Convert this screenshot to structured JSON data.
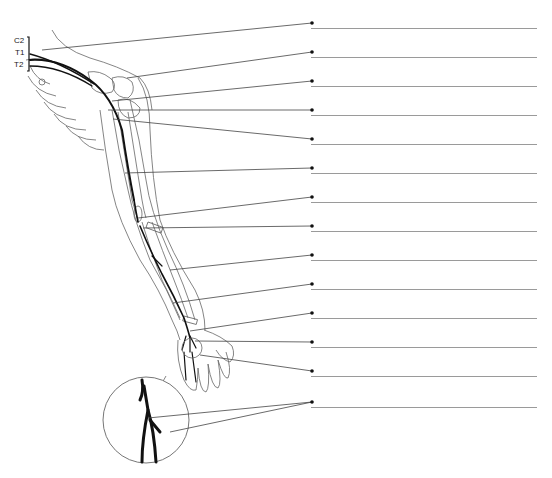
{
  "diagram": {
    "spinal_segment_labels": [
      "C2",
      "T1",
      "T2"
    ],
    "answer_line_count": 14,
    "answers": [
      {
        "index": 1,
        "text": ""
      },
      {
        "index": 2,
        "text": ""
      },
      {
        "index": 3,
        "text": ""
      },
      {
        "index": 4,
        "text": ""
      },
      {
        "index": 5,
        "text": ""
      },
      {
        "index": 6,
        "text": ""
      },
      {
        "index": 7,
        "text": ""
      },
      {
        "index": 8,
        "text": ""
      },
      {
        "index": 9,
        "text": ""
      },
      {
        "index": 10,
        "text": ""
      },
      {
        "index": 11,
        "text": ""
      },
      {
        "index": 12,
        "text": ""
      },
      {
        "index": 13,
        "text": ""
      },
      {
        "index": 14,
        "text": ""
      }
    ],
    "inset": "magnified view of wrist nerve branching",
    "caption": "",
    "colors": {
      "nerve": "#111111",
      "outline": "#555555",
      "leader": "#444444",
      "answer_line": "#9a9a9a"
    }
  }
}
